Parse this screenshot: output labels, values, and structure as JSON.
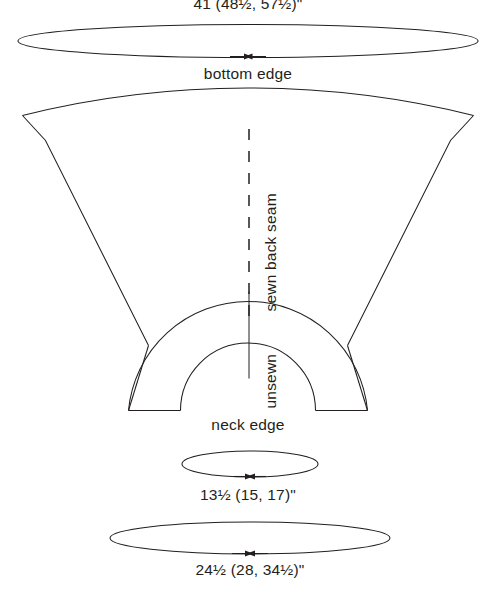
{
  "diagram": {
    "type": "garment-schematic",
    "labels": {
      "top_measurement": "41 (48½, 57½)\"",
      "bottom_edge": "bottom edge",
      "sewn_back_seam": "sewn back seam",
      "unsewn": "unsewn",
      "neck_edge": "neck edge",
      "neck_measurement": "13½ (15, 17)\"",
      "mid_measurement": "24½ (28, 34½)\""
    },
    "colors": {
      "stroke": "#231f20",
      "background": "#ffffff",
      "text": "#231f20"
    }
  }
}
